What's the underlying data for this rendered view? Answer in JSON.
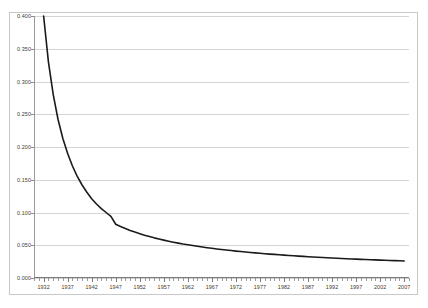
{
  "chart_data": {
    "type": "line",
    "title": "",
    "subtitle": "",
    "xlabel": "",
    "ylabel": "",
    "grid": "horizontal",
    "legend": "none",
    "xlim": [
      1930,
      2008
    ],
    "ylim": [
      0.0,
      0.4
    ],
    "y_ticks": [
      0.0,
      0.05,
      0.1,
      0.15,
      0.2,
      0.25,
      0.3,
      0.35,
      0.4
    ],
    "y_tick_labels": [
      "0.000",
      "0.050",
      "0.100",
      "0.150",
      "0.200",
      "0.250",
      "0.300",
      "0.350",
      "0.400"
    ],
    "x_tick_labels": [
      "1932",
      "1937",
      "1942",
      "1947",
      "1952",
      "1957",
      "1962",
      "1967",
      "1972",
      "1977",
      "1982",
      "1987",
      "1992",
      "1997",
      "2002",
      "2007"
    ],
    "x_tick_values": [
      1932,
      1937,
      1942,
      1947,
      1952,
      1957,
      1962,
      1967,
      1972,
      1977,
      1982,
      1987,
      1992,
      1997,
      2002,
      2007
    ],
    "x_minor_tick_step": 1,
    "series": [
      {
        "name": "series-1",
        "color": "#1a1a1a",
        "x": [
          1932,
          1933,
          1934,
          1935,
          1936,
          1937,
          1938,
          1939,
          1940,
          1941,
          1942,
          1943,
          1944,
          1945,
          1946,
          1947,
          1948,
          1949,
          1950,
          1951,
          1952,
          1953,
          1954,
          1955,
          1956,
          1957,
          1958,
          1959,
          1960,
          1961,
          1962,
          1963,
          1964,
          1965,
          1966,
          1967,
          1968,
          1969,
          1970,
          1971,
          1972,
          1973,
          1974,
          1975,
          1976,
          1977,
          1978,
          1979,
          1980,
          1981,
          1982,
          1983,
          1984,
          1985,
          1986,
          1987,
          1988,
          1989,
          1990,
          1991,
          1992,
          1993,
          1994,
          1995,
          1996,
          1997,
          1998,
          1999,
          2000,
          2001,
          2002,
          2003,
          2004,
          2005,
          2006,
          2007
        ],
        "y": [
          0.4,
          0.33,
          0.28,
          0.242,
          0.213,
          0.19,
          0.171,
          0.155,
          0.142,
          0.131,
          0.121,
          0.113,
          0.106,
          0.1,
          0.094,
          0.082,
          0.0785,
          0.0755,
          0.0727,
          0.0701,
          0.0677,
          0.0654,
          0.0633,
          0.0613,
          0.0595,
          0.0578,
          0.0562,
          0.0547,
          0.0533,
          0.0519,
          0.0507,
          0.0495,
          0.0484,
          0.0473,
          0.0463,
          0.0453,
          0.0444,
          0.0435,
          0.0427,
          0.0419,
          0.0411,
          0.0404,
          0.0397,
          0.039,
          0.0383,
          0.0377,
          0.0371,
          0.0365,
          0.036,
          0.0354,
          0.0349,
          0.0344,
          0.0339,
          0.0334,
          0.033,
          0.0325,
          0.0321,
          0.0317,
          0.0313,
          0.0309,
          0.0305,
          0.0301,
          0.0298,
          0.0294,
          0.0291,
          0.0288,
          0.0285,
          0.0282,
          0.0279,
          0.0276,
          0.0273,
          0.027,
          0.0268,
          0.0265,
          0.0263,
          0.026
        ]
      }
    ]
  }
}
